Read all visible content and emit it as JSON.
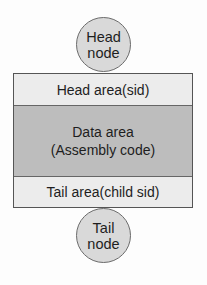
{
  "diagram": {
    "head_node": {
      "line1": "Head",
      "line2": "node"
    },
    "head_area": {
      "label": "Head area(sid)"
    },
    "data_area": {
      "line1": "Data area",
      "line2": "(Assembly code)"
    },
    "tail_area": {
      "label": "Tail area(child sid)"
    },
    "tail_node": {
      "line1": "Tail",
      "line2": "node"
    },
    "colors": {
      "node_fill": "#d9d9d9",
      "head_tail_area_fill": "#ececec",
      "data_area_fill": "#bdbdbd",
      "border": "#555555"
    }
  }
}
